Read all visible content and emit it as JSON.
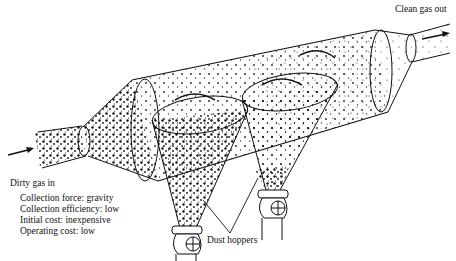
{
  "diagram": {
    "labels": {
      "inlet": "Dirty gas in",
      "outlet": "Clean gas out",
      "hoppers": "Dust hoppers"
    },
    "properties": [
      {
        "text": "Collection force:  gravity"
      },
      {
        "text": "Collection efficiency:  low"
      },
      {
        "text": "Initial cost:  inexpensive"
      },
      {
        "text": "Operating cost:  low"
      }
    ],
    "colors": {
      "ink": "#111111",
      "background": "#ffffff"
    }
  }
}
